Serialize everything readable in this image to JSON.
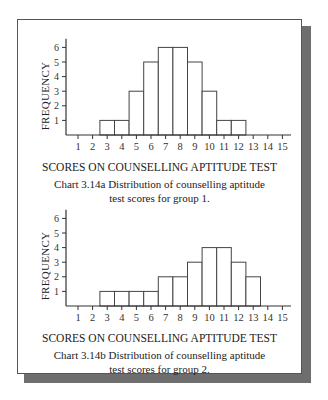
{
  "chart_data": [
    {
      "type": "bar",
      "title": "Chart 3.14a  Distribution of counselling aptitude test scores for group 1.",
      "xlabel": "SCORES ON COUNSELLING APTITUDE TEST",
      "ylabel": "FREQUENCY",
      "categories": [
        "1",
        "2",
        "3",
        "4",
        "5",
        "6",
        "7",
        "8",
        "9",
        "10",
        "11",
        "12",
        "13",
        "14",
        "15"
      ],
      "values": [
        0,
        0,
        1,
        1,
        3,
        5,
        6,
        6,
        5,
        3,
        1,
        1,
        0,
        0,
        0
      ],
      "yticks": [
        1,
        2,
        3,
        4,
        5,
        6
      ],
      "ylim": [
        0,
        6.5
      ],
      "grid": false,
      "legend": null
    },
    {
      "type": "bar",
      "title": "Chart 3.14b  Distribution of counselling aptitude test scores for group 2.",
      "xlabel": "SCORES ON COUNSELLING APTITUDE TEST",
      "ylabel": "FREQUENCY",
      "categories": [
        "1",
        "2",
        "3",
        "4",
        "5",
        "6",
        "7",
        "8",
        "9",
        "10",
        "11",
        "12",
        "13",
        "14",
        "15"
      ],
      "values": [
        0,
        0,
        1,
        1,
        1,
        1,
        2,
        2,
        3,
        4,
        4,
        3,
        2,
        0,
        0
      ],
      "yticks": [
        1,
        2,
        3,
        4,
        5,
        6
      ],
      "ylim": [
        0,
        6.5
      ],
      "grid": false,
      "legend": null
    }
  ],
  "charts": [
    {
      "ylabel": "FREQUENCY",
      "xlabel": "SCORES ON COUNSELLING APTITUDE TEST",
      "caption_line1": "Chart 3.14a  Distribution of counselling aptitude",
      "caption_line2": "test scores for group 1."
    },
    {
      "ylabel": "FREQUENCY",
      "xlabel": "SCORES ON COUNSELLING APTITUDE TEST",
      "caption_line1": "Chart 3.14b  Distribution of counselling aptitude",
      "caption_line2": "test scores for group 2."
    }
  ],
  "style": {
    "bar_fill": "#ffffff",
    "bar_stroke": "#444444",
    "axis_color": "#333333",
    "shadow_color": "#6e6e6e"
  }
}
